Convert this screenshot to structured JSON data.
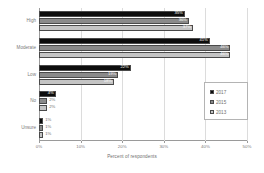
{
  "chart_data": {
    "type": "bar",
    "orientation": "horizontal",
    "title": "",
    "xlabel": "Percent of respondents",
    "ylabel": "",
    "xlim": [
      0,
      50
    ],
    "xticks": [
      "0%",
      "10%",
      "20%",
      "30%",
      "40%",
      "50%"
    ],
    "xtick_values": [
      0,
      10,
      20,
      30,
      40,
      50
    ],
    "grid": true,
    "legend_position": "right",
    "categories": [
      "High",
      "Moderate",
      "Low",
      "No",
      "Unsure"
    ],
    "series": [
      {
        "name": "2017",
        "color": "#0d0d0d",
        "values": [
          35,
          41,
          22,
          4,
          1
        ],
        "labels": [
          "35%",
          "41%",
          "22%",
          "4%",
          "1%"
        ]
      },
      {
        "name": "2015",
        "color": "#8a8a8a",
        "values": [
          36,
          46,
          19,
          2,
          1
        ],
        "labels": [
          "36%",
          "46%",
          "19%",
          "2%",
          "1%"
        ]
      },
      {
        "name": "2013",
        "color": "#c4c4c4",
        "values": [
          37,
          46,
          18,
          2,
          1
        ],
        "labels": [
          "37%",
          "46%",
          "18%",
          "2%",
          "1%"
        ]
      }
    ]
  },
  "legend": {
    "items": [
      {
        "label": "2017"
      },
      {
        "label": "2015"
      },
      {
        "label": "2013"
      }
    ]
  },
  "axis": {
    "x_title": "Percent of respondents"
  }
}
